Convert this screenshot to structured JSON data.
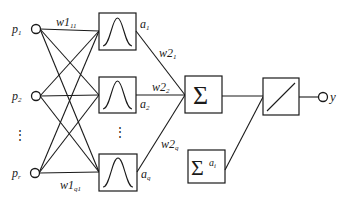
{
  "diagram": {
    "type": "rbf-neural-network",
    "inputs": [
      {
        "base": "p",
        "sub": "1"
      },
      {
        "base": "p",
        "sub": "2"
      },
      {
        "base": "p",
        "sub": "r"
      }
    ],
    "input_ellipsis": "⋮",
    "first_layer_weights": {
      "top": {
        "base": "w1",
        "sub": "11"
      },
      "bottom": {
        "base": "w1",
        "sub": "q1"
      }
    },
    "hidden_units": [
      {
        "activation": "gaussian",
        "output": {
          "base": "a",
          "sub": "1"
        }
      },
      {
        "activation": "gaussian",
        "output": {
          "base": "a",
          "sub": "2"
        }
      },
      {
        "activation": "gaussian",
        "output": {
          "base": "a",
          "sub": "q"
        }
      }
    ],
    "hidden_ellipsis": "⋮",
    "second_layer_weights": [
      {
        "base": "w2",
        "sub": "1"
      },
      {
        "base": "w2",
        "sub": "2"
      },
      {
        "base": "w2",
        "sub": "q"
      }
    ],
    "summation_symbol": "Σ",
    "normalizer": {
      "symbol": "Σ",
      "base": "a",
      "sub": "i"
    },
    "output_unit": {
      "activation": "linear"
    },
    "output": {
      "label": "y"
    },
    "colors": {
      "stroke": "#1a1a1a",
      "background": "#ffffff"
    }
  }
}
